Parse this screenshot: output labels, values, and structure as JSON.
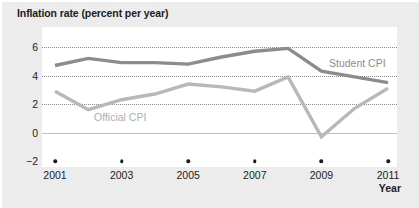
{
  "chart_data": {
    "type": "line",
    "title": "Inflation rate (percent per year)",
    "xlabel": "Year",
    "ylabel": "",
    "xlim": [
      2001,
      2011
    ],
    "ylim": [
      -2,
      6
    ],
    "ytick_labels": [
      "6",
      "4",
      "2",
      "0",
      "−2"
    ],
    "ytick_values": [
      6,
      4,
      2,
      0,
      -2
    ],
    "xtick_labels": [
      "2001",
      "2003",
      "2005",
      "2007",
      "2009",
      "2011"
    ],
    "xtick_values": [
      2001,
      2003,
      2005,
      2007,
      2009,
      2011
    ],
    "grid": "horizontal dotted gridlines at 6, 4, 2; solid line at 0",
    "legend": "inline series labels",
    "x": [
      2001,
      2002,
      2003,
      2004,
      2005,
      2006,
      2007,
      2008,
      2009,
      2010,
      2011
    ],
    "series": [
      {
        "name": "Student CPI",
        "color": "#8c8c8c",
        "values": [
          4.7,
          5.2,
          4.9,
          4.9,
          4.8,
          5.3,
          5.7,
          5.9,
          4.3,
          3.9,
          3.5
        ]
      },
      {
        "name": "Official CPI",
        "color": "#b8b8b8",
        "values": [
          2.9,
          1.6,
          2.3,
          2.7,
          3.4,
          3.2,
          2.9,
          3.9,
          -0.3,
          1.7,
          3.1
        ]
      }
    ],
    "annotations": [
      {
        "text": "Student CPI",
        "x": 2009.0,
        "y": 5.1
      },
      {
        "text": "Official CPI",
        "x": 2002.8,
        "y": 1.25
      }
    ]
  },
  "colors": {
    "figure_background": "#ececec",
    "plot_background": "#ffffff",
    "text": "#1d1d1d",
    "gridline": "#8a8a8a",
    "zeroline": "#bfbfbf",
    "student_cpi": "#8c8c8c",
    "official_cpi": "#b8b8b8"
  }
}
